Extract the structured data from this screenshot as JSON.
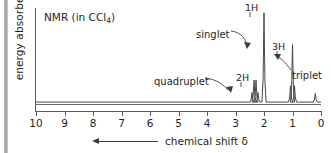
{
  "figure": {
    "title": "NMR (in CCl",
    "title_subscript": "4",
    "title_suffix": ")",
    "y_axis_label": "energy absorbed",
    "x_axis_caption": "chemical shift δ",
    "x_arrow_direction": "left",
    "line_color": "#4a4a4a",
    "axis_color": "#5a5a5a",
    "text_color": "#231f20"
  },
  "annotations": [
    {
      "name": "singlet-label",
      "text": "singlet",
      "x": 196,
      "y": 29
    },
    {
      "name": "quadruplet-label",
      "text": "quadruplet",
      "x": 154,
      "y": 76
    },
    {
      "name": "triplet-label",
      "text": "triplet",
      "x": 292,
      "y": 70
    }
  ],
  "peak_labels": [
    {
      "name": "integration-1h",
      "text": "1H",
      "x": 245,
      "y": 2
    },
    {
      "name": "integration-2h",
      "text": "2H",
      "x": 236,
      "y": 72
    },
    {
      "name": "integration-3h",
      "text": "3H",
      "x": 272,
      "y": 41
    }
  ],
  "chart_data": {
    "type": "line",
    "title": "NMR (in CCl4)",
    "xlabel": "chemical shift δ",
    "ylabel": "energy absorbed",
    "xlim": [
      10,
      0
    ],
    "x_axis_reversed": true,
    "ylim": [
      0,
      1
    ],
    "grid": false,
    "legend": null,
    "xticks": [
      10,
      9,
      8,
      7,
      6,
      5,
      4,
      3,
      2,
      1,
      0
    ],
    "xticklabels": [
      "10",
      "9",
      "8",
      "7",
      "6",
      "5",
      "4",
      "3",
      "2",
      "1",
      "0"
    ],
    "baseline_y": 0.02,
    "signals": [
      {
        "name": "quadruplet",
        "multiplicity": "quadruplet",
        "integration": "2H",
        "center_shift": 2.3,
        "lines": [
          {
            "shift": 2.42,
            "height": 0.1
          },
          {
            "shift": 2.35,
            "height": 0.23
          },
          {
            "shift": 2.28,
            "height": 0.23
          },
          {
            "shift": 2.21,
            "height": 0.1
          }
        ]
      },
      {
        "name": "singlet",
        "multiplicity": "singlet",
        "integration": "1H",
        "center_shift": 2.0,
        "lines": [
          {
            "shift": 2.0,
            "height": 0.93
          }
        ]
      },
      {
        "name": "triplet",
        "multiplicity": "triplet",
        "integration": "3H",
        "center_shift": 1.0,
        "lines": [
          {
            "shift": 1.07,
            "height": 0.17
          },
          {
            "shift": 1.0,
            "height": 0.6
          },
          {
            "shift": 0.93,
            "height": 0.17
          }
        ]
      },
      {
        "name": "reference-peak",
        "multiplicity": "singlet",
        "integration": "",
        "center_shift": 0.2,
        "lines": [
          {
            "shift": 0.2,
            "height": 0.09
          }
        ]
      }
    ]
  }
}
